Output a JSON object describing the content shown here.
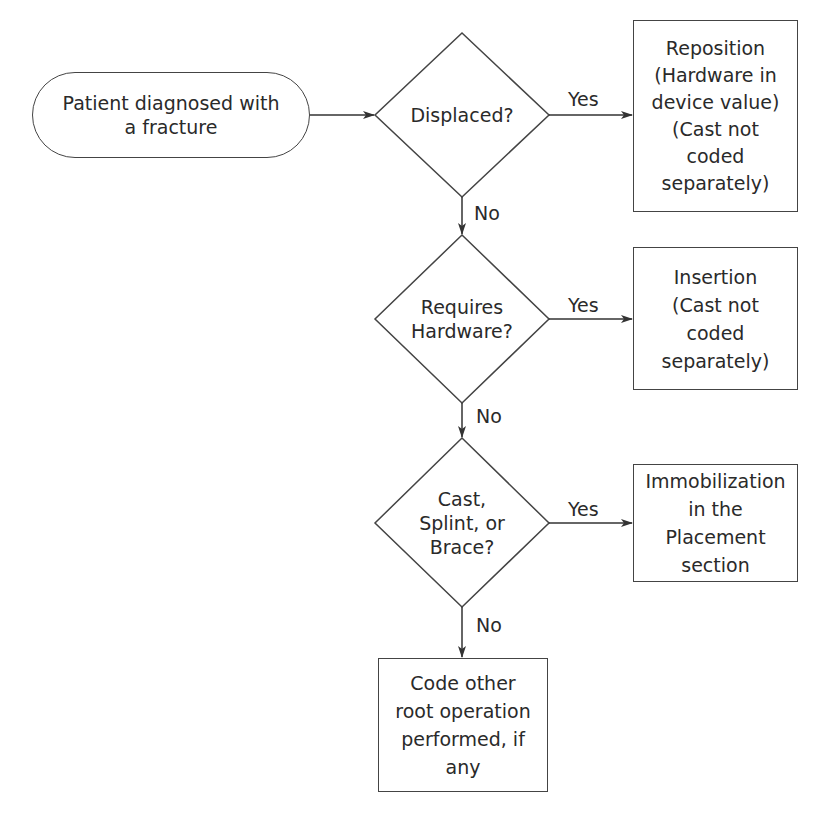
{
  "diagram": {
    "type": "flowchart",
    "start": {
      "text": "Patient diagnosed with\na fracture"
    },
    "decisions": [
      {
        "id": "d1",
        "text": "Displaced?"
      },
      {
        "id": "d2",
        "text": "Requires\nHardware?"
      },
      {
        "id": "d3",
        "text": "Cast,\nSplint, or\nBrace?"
      }
    ],
    "outcomes": [
      {
        "id": "o1",
        "text": "Reposition\n(Hardware in\ndevice value)\n(Cast not\ncoded\nseparately)"
      },
      {
        "id": "o2",
        "text": "Insertion\n(Cast not\ncoded\nseparately)"
      },
      {
        "id": "o3",
        "text": "Immobilization\nin the\nPlacement\nsection"
      },
      {
        "id": "o4",
        "text": "Code other\nroot operation\nperformed, if\nany"
      }
    ],
    "edge_labels": {
      "yes": "Yes",
      "no": "No"
    },
    "edges": [
      {
        "from": "start",
        "to": "d1",
        "label": ""
      },
      {
        "from": "d1",
        "to": "o1",
        "label": "Yes"
      },
      {
        "from": "d1",
        "to": "d2",
        "label": "No"
      },
      {
        "from": "d2",
        "to": "o2",
        "label": "Yes"
      },
      {
        "from": "d2",
        "to": "d3",
        "label": "No"
      },
      {
        "from": "d3",
        "to": "o3",
        "label": "Yes"
      },
      {
        "from": "d3",
        "to": "o4",
        "label": "No"
      }
    ]
  }
}
